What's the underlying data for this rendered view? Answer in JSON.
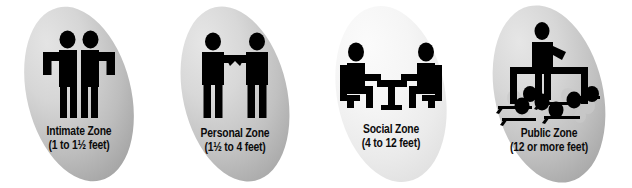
{
  "diagram": {
    "background_color": "#ffffff",
    "figure_color": "#000000",
    "text_color": "#0b0b0b"
  },
  "zones": [
    {
      "id": "intimate",
      "title": "Intimate Zone",
      "distance": "(1 to 1½ feet)",
      "icon": "two-people-embracing-icon",
      "ellipse_fill_light": "#d9d9d9",
      "ellipse_fill_dark": "#9b9b9b"
    },
    {
      "id": "personal",
      "title": "Personal Zone",
      "distance": "(1½ to 4 feet)",
      "icon": "two-people-handshake-icon",
      "ellipse_fill_light": "#dcdcdc",
      "ellipse_fill_dark": "#a2a2a2"
    },
    {
      "id": "social",
      "title": "Social Zone",
      "distance": "(4 to 12 feet)",
      "icon": "two-people-at-table-icon",
      "ellipse_fill_light": "#f2f2f2",
      "ellipse_fill_dark": "#d8d8d8"
    },
    {
      "id": "public",
      "title": "Public Zone",
      "distance": "(12 or more feet)",
      "icon": "speaker-with-audience-icon",
      "ellipse_fill_light": "#dcdcdc",
      "ellipse_fill_dark": "#9d9d9d"
    }
  ]
}
